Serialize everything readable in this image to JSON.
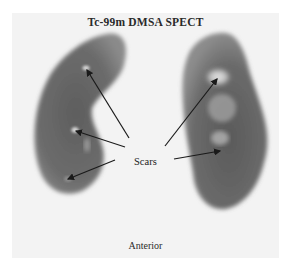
{
  "figure": {
    "title": "Tc-99m DMSA SPECT",
    "annotation_label": "Scars",
    "view_label": "Anterior",
    "colors": {
      "background": "#f3f3f3",
      "kidney_tissue": "#6e6e6e",
      "scar_highlight": "#d8d8d8",
      "arrow": "#1a1a1a"
    },
    "kidneys": [
      {
        "side": "left-of-image",
        "scar_count": 3
      },
      {
        "side": "right-of-image",
        "scar_count": 2
      }
    ]
  }
}
